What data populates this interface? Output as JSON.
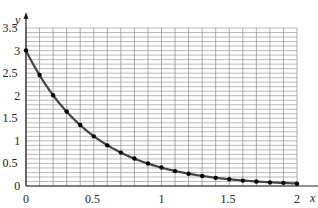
{
  "chart_data": {
    "type": "line",
    "title": "",
    "xlabel": "x",
    "ylabel": "y",
    "xlim": [
      0,
      2
    ],
    "ylim": [
      0,
      3.5
    ],
    "grid": true,
    "x_ticks": [
      "0",
      "0.5",
      "1",
      "1.5",
      "2"
    ],
    "y_ticks": [
      "0",
      "0.5",
      "1",
      "1.5",
      "2",
      "2.5",
      "3",
      "3.5"
    ],
    "series": [
      {
        "name": "y = 3e^(-2x)",
        "x": [
          0,
          0.1,
          0.2,
          0.3,
          0.4,
          0.5,
          0.6,
          0.7,
          0.8,
          0.9,
          1.0,
          1.1,
          1.2,
          1.3,
          1.4,
          1.5,
          1.6,
          1.7,
          1.8,
          1.9,
          2.0
        ],
        "values": [
          3.0,
          2.46,
          2.01,
          1.65,
          1.35,
          1.1,
          0.9,
          0.74,
          0.61,
          0.5,
          0.41,
          0.33,
          0.27,
          0.22,
          0.18,
          0.15,
          0.12,
          0.1,
          0.08,
          0.07,
          0.05
        ]
      }
    ]
  }
}
